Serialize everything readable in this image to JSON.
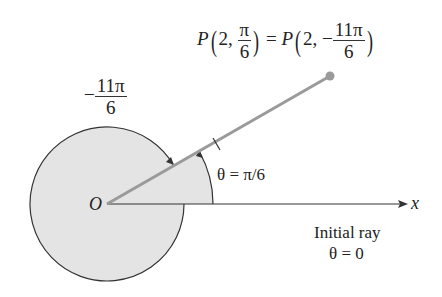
{
  "figure": {
    "point_label": {
      "name": "P",
      "r": "2",
      "theta_num": "π",
      "theta_den": "6",
      "equals": "=",
      "alt_r": "2",
      "alt_sign": "−",
      "alt_theta_num": "11π",
      "alt_theta_den": "6"
    },
    "negative_angle_label": {
      "sign": "−",
      "num": "11π",
      "den": "6"
    },
    "origin_label": "O",
    "theta_label": "θ = π/6",
    "axis_label": "x",
    "initial_ray_label": "Initial ray",
    "initial_ray_theta": "θ = 0",
    "colors": {
      "fill": "#e4e4e4",
      "ray": "#9a9a9a",
      "point": "#9a9a9a",
      "stroke": "#333333"
    }
  }
}
